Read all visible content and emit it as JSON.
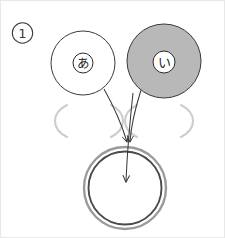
{
  "figure": {
    "caption_number": "1",
    "background_color": "#ffffff",
    "ink_color": "#3a3a3a",
    "gray_fill": "#b8b8b8",
    "ghost_color": "#cdcdcd",
    "ring_outer_color": "#9a9a9a",
    "ring_inner_color": "#4a4a4a"
  },
  "step_label": {
    "name": "circled-number-one",
    "text": "1"
  },
  "nodes": [
    {
      "id": "node-a",
      "label": "あ",
      "label_romaji": "a",
      "fill": "#ffffff",
      "stroke": "#3a3a3a",
      "cx": 82,
      "cy": 62,
      "r": 32,
      "badge_r": 10,
      "badge_fill": "#ffffff"
    },
    {
      "id": "node-i",
      "label": "い",
      "label_romaji": "i",
      "fill": "#b8b8b8",
      "stroke": "#3a3a3a",
      "cx": 163,
      "cy": 60,
      "r": 37,
      "badge_r": 11,
      "badge_fill": "#ffffff"
    }
  ],
  "placeholders": [
    {
      "id": "ghost-left",
      "cx": 88,
      "cy": 120,
      "rx": 30,
      "ry": 20,
      "color": "#cdcdcd"
    },
    {
      "id": "ghost-right",
      "cx": 158,
      "cy": 120,
      "rx": 30,
      "ry": 20,
      "color": "#cdcdcd"
    }
  ],
  "target": {
    "id": "target-ring",
    "cx": 124,
    "cy": 187,
    "r_outer": 41,
    "r_inner": 37,
    "outer_color": "#9a9a9a",
    "inner_color": "#4a4a4a",
    "fill": "#ffffff"
  },
  "arrows": [
    {
      "id": "arrow-from-a",
      "from": "node-a",
      "to": "target-ring-top",
      "color": "#3a3a3a"
    },
    {
      "id": "arrow-from-i",
      "from": "node-i",
      "to": "target-ring-top",
      "color": "#3a3a3a"
    },
    {
      "id": "arrow-into-center",
      "from": "node-i",
      "to": "target-ring-center",
      "color": "#3a3a3a"
    }
  ]
}
